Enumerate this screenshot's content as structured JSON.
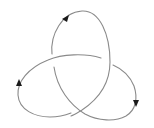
{
  "diagram": {
    "title": "Trefoil knot (oriented)",
    "type": "knot-diagram",
    "stroke_color": "#8a8a8a",
    "arrow_color": "#1a1a1a",
    "crossings": 3,
    "arrows": [
      {
        "name": "top-lobe-arrow",
        "x": 66,
        "y": 19,
        "direction": "up-right"
      },
      {
        "name": "left-lobe-arrow",
        "x": 20,
        "y": 83,
        "direction": "up"
      },
      {
        "name": "right-lobe-arrow",
        "x": 136,
        "y": 104,
        "direction": "down"
      }
    ]
  }
}
